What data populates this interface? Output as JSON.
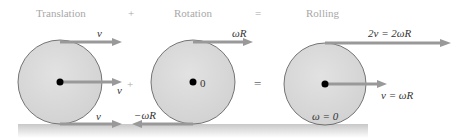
{
  "figure": {
    "titles": {
      "translation": "Translation",
      "rotation": "Rotation",
      "rolling": "Rolling"
    },
    "operators": {
      "plus_top": "+",
      "equals_top": "=",
      "plus_mid": "+",
      "equals_mid": "="
    },
    "translation": {
      "top_label": "v",
      "center_label": "v",
      "bottom_label": "v"
    },
    "rotation": {
      "top_label": "ωR",
      "center_label": "0",
      "bottom_label": "−ωR"
    },
    "rolling": {
      "top_label": "2v = 2ωR",
      "center_label": "v = ωR",
      "bottom_label": "ω = 0"
    },
    "colors": {
      "wheel_fill": "#d9d9d9",
      "wheel_stroke": "#555555",
      "arrow": "#999999",
      "ground": "#d4d4d4",
      "hub": "#000000"
    }
  }
}
